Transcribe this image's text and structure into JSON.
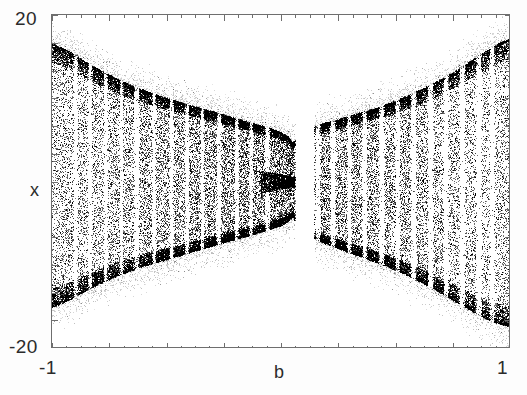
{
  "figure": {
    "background": "#ffffff",
    "ink_color": "#1a1a1a",
    "frame_color": "#6e6e6e"
  },
  "axes": {
    "y_axis_name": "x",
    "x_axis_name": "b",
    "y_max_label": "20",
    "y_min_label": "-20",
    "x_min_label": "-1",
    "x_max_label": "1",
    "y_range": [
      -20,
      20
    ],
    "x_range": [
      -1,
      1
    ],
    "x_major_ticks": 9,
    "y_major_ticks": 13,
    "ticks_inward": true,
    "ticks_on_all_sides": true,
    "grid": false
  },
  "chart_data": {
    "type": "scatter",
    "title": "",
    "subtitle": "",
    "xlabel": "b",
    "ylabel": "x",
    "xlim": [
      -1,
      1
    ],
    "ylim": [
      -20,
      20
    ],
    "xticklabels": [
      "-1",
      "1"
    ],
    "yticklabels": [
      "20",
      "-20"
    ],
    "grid": false,
    "legend": null,
    "point_color": "#111111",
    "envelope": {
      "comment": "Half-amplitude of the attractor band in x-units, sampled across b.",
      "b": [
        -1.0,
        -0.95,
        -0.9,
        -0.85,
        -0.8,
        -0.75,
        -0.7,
        -0.65,
        -0.6,
        -0.55,
        -0.5,
        -0.45,
        -0.4,
        -0.35,
        -0.3,
        -0.25,
        -0.2,
        -0.15,
        -0.1,
        -0.05,
        0.0,
        0.03,
        0.05,
        0.08,
        0.12,
        0.16,
        0.2,
        0.25,
        0.3,
        0.35,
        0.4,
        0.45,
        0.5,
        0.55,
        0.6,
        0.65,
        0.7,
        0.75,
        0.8,
        0.85,
        0.9,
        0.95,
        1.0
      ],
      "upper": [
        16.5,
        16.0,
        15.2,
        14.3,
        13.5,
        12.8,
        12.1,
        11.5,
        11.0,
        10.5,
        10.0,
        9.6,
        9.2,
        8.8,
        8.4,
        8.0,
        7.6,
        7.2,
        6.8,
        6.4,
        5.9,
        5.4,
        4.6,
        5.8,
        6.4,
        6.8,
        7.1,
        7.5,
        7.9,
        8.3,
        8.7,
        9.2,
        9.7,
        10.3,
        10.9,
        11.6,
        12.3,
        13.1,
        14.0,
        14.9,
        15.8,
        16.6,
        17.2
      ],
      "lower": [
        -15.0,
        -14.5,
        -13.8,
        -13.0,
        -12.3,
        -11.7,
        -11.1,
        -10.6,
        -10.1,
        -9.7,
        -9.3,
        -8.9,
        -8.5,
        -8.1,
        -7.7,
        -7.3,
        -6.9,
        -6.5,
        -6.1,
        -5.7,
        -5.2,
        -4.7,
        -4.2,
        -5.6,
        -6.4,
        -7.0,
        -7.5,
        -8.0,
        -8.5,
        -9.0,
        -9.5,
        -10.0,
        -10.6,
        -11.2,
        -11.9,
        -12.6,
        -13.4,
        -14.2,
        -15.0,
        -15.8,
        -16.5,
        -17.0,
        -17.4
      ]
    },
    "periodic_windows": {
      "comment": "b-intervals where the attractor collapses to narrow periodic bands (rendered as vertical white gaps).",
      "intervals": [
        [
          -0.905,
          -0.888
        ],
        [
          -0.842,
          -0.826
        ],
        [
          -0.773,
          -0.757
        ],
        [
          -0.704,
          -0.69
        ],
        [
          -0.641,
          -0.62
        ],
        [
          -0.563,
          -0.548
        ],
        [
          -0.487,
          -0.47
        ],
        [
          -0.42,
          -0.402
        ],
        [
          -0.352,
          -0.337
        ],
        [
          -0.281,
          -0.262
        ],
        [
          -0.203,
          -0.186
        ],
        [
          -0.14,
          -0.124
        ],
        [
          -0.072,
          -0.05
        ],
        [
          0.148,
          0.17
        ],
        [
          0.214,
          0.236
        ],
        [
          0.287,
          0.305
        ],
        [
          0.352,
          0.372
        ],
        [
          0.425,
          0.448
        ],
        [
          0.497,
          0.516
        ],
        [
          0.564,
          0.588
        ],
        [
          0.638,
          0.661
        ],
        [
          0.707,
          0.728
        ],
        [
          0.776,
          0.8
        ],
        [
          0.848,
          0.872
        ],
        [
          0.908,
          0.928
        ]
      ]
    },
    "pinch": {
      "b": 0.05,
      "half_width": 0.6,
      "note": "attractor narrows to a thin filament before re-expanding"
    },
    "gap": {
      "comment": "Blank wedge between the left and right lobes where no attractor points exist.",
      "b_start": 0.06,
      "b_end": 0.145
    },
    "density": {
      "n_points_rendered": 52000,
      "edge_enhancement": true,
      "note": "Point density is highest near the envelope edges and inside the band interior, giving a dark speckled texture."
    }
  }
}
